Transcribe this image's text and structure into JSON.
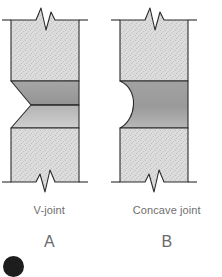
{
  "figure": {
    "panels": [
      {
        "id": "A",
        "name": "V-joint",
        "letter": "A",
        "joint_profile": "v-groove",
        "description": "Rectangular plate section with break lines top and bottom and a horizontal weld band having a V-shaped notch on the left edge"
      },
      {
        "id": "B",
        "name": "Concave joint",
        "letter": "B",
        "joint_profile": "concave-groove",
        "description": "Rectangular plate section with break lines top and bottom and a horizontal weld band having a concave arc on the left edge"
      }
    ]
  },
  "colors": {
    "page_background": "#ffffff",
    "plate_fill": "#d9d9d9",
    "plate_speckle": "#c4c4c4",
    "weld_band_upper": "#9c9c9c",
    "weld_band_lower": "#a9a9a9",
    "weld_band_solid": "#9e9e9e",
    "outline": "#2b2b2b",
    "caption_text": "#6e6e6e",
    "letter_text": "#6a6a6a",
    "badge": "#1d1d1d"
  },
  "geometry": {
    "panel_a": {
      "left": 11,
      "right": 79,
      "top": 20,
      "bottom": 182,
      "band_top": 81,
      "band_mid": 105,
      "band_bottom": 128,
      "notch_depth": 20
    },
    "panel_b": {
      "left": 120,
      "right": 188,
      "top": 20,
      "bottom": 182,
      "band_top": 81,
      "band_bottom": 128,
      "arc_depth": 20
    }
  },
  "captions": {
    "name_a": "V-joint",
    "name_b": "Concave joint",
    "letter_a": "A",
    "letter_b": "B"
  },
  "icons": {
    "corner_badge": "filled-circle-badge"
  }
}
